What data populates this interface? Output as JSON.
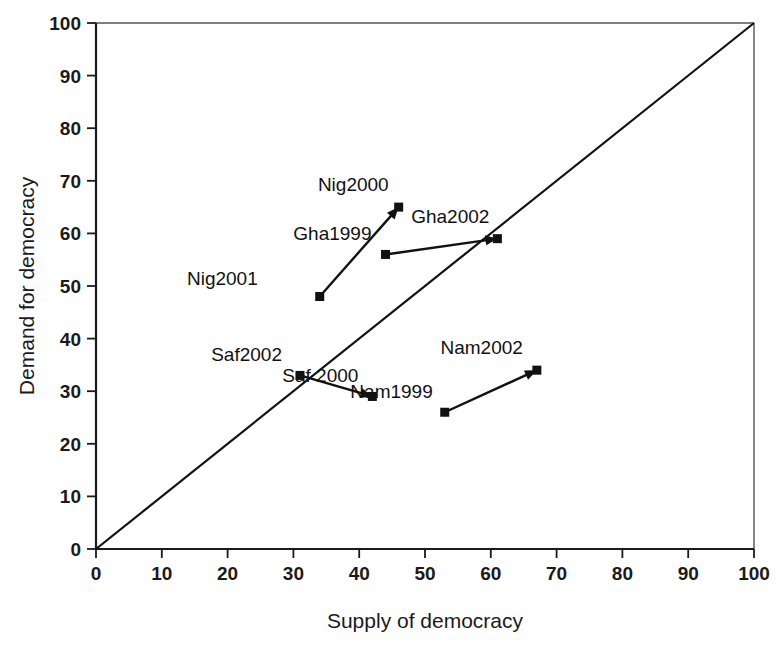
{
  "chart_data": {
    "type": "scatter",
    "title": "",
    "xlabel": "Supply of democracy",
    "ylabel": "Demand for democracy",
    "xlim": [
      0,
      100
    ],
    "ylim": [
      0,
      100
    ],
    "xticks": [
      0,
      10,
      20,
      30,
      40,
      50,
      60,
      70,
      80,
      90,
      100
    ],
    "yticks": [
      0,
      10,
      20,
      30,
      40,
      50,
      60,
      70,
      80,
      90,
      100
    ],
    "grid": false,
    "legend": "none",
    "reference_line": {
      "name": "45-degree equality line",
      "from": [
        0,
        0
      ],
      "to": [
        100,
        100
      ]
    },
    "points": [
      {
        "label": "Nig2001",
        "x": 34,
        "y": 48,
        "label_dx": -62,
        "label_dy": -12
      },
      {
        "label": "Nig2000",
        "x": 46,
        "y": 65,
        "label_dx": -10,
        "label_dy": -16
      },
      {
        "label": "Gha1999",
        "x": 44,
        "y": 56,
        "label_dx": -14,
        "label_dy": -14
      },
      {
        "label": "Gha2002",
        "x": 61,
        "y": 59,
        "label_dx": -8,
        "label_dy": -16
      },
      {
        "label": "Saf2002",
        "x": 31,
        "y": 33,
        "label_dx": -18,
        "label_dy": -14
      },
      {
        "label": "Saf 2000",
        "x": 42,
        "y": 29,
        "label_dx": -14,
        "label_dy": -14
      },
      {
        "label": "Nam1999",
        "x": 53,
        "y": 26,
        "label_dx": -12,
        "label_dy": -14
      },
      {
        "label": "Nam2002",
        "x": 67,
        "y": 34,
        "label_dx": -14,
        "label_dy": -16
      }
    ],
    "arrows": [
      {
        "name": "nigeria-trend",
        "from": "Nig2001",
        "to": "Nig2000",
        "from_xy": [
          34,
          48
        ],
        "to_xy": [
          46,
          65
        ]
      },
      {
        "name": "ghana-trend",
        "from": "Gha1999",
        "to": "Gha2002",
        "from_xy": [
          44,
          56
        ],
        "to_xy": [
          61,
          59
        ]
      },
      {
        "name": "south-africa-trend",
        "from": "Saf2002",
        "to": "Saf 2000",
        "from_xy": [
          31,
          33
        ],
        "to_xy": [
          42,
          29
        ]
      },
      {
        "name": "namibia-trend",
        "from": "Nam1999",
        "to": "Nam2002",
        "from_xy": [
          53,
          26
        ],
        "to_xy": [
          67,
          34
        ]
      }
    ],
    "colors": {
      "marker": "#111111",
      "line": "#111111",
      "axis": "#1a1a1a",
      "background": "#ffffff"
    }
  }
}
